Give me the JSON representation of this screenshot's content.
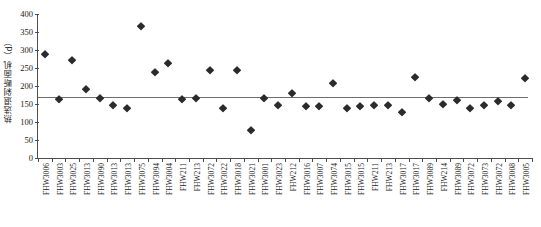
{
  "chart_data": {
    "type": "scatter",
    "title": "",
    "subtitle": "",
    "xlabel": "",
    "ylabel": "热选退剁断面机（d）",
    "ylim": [
      0,
      400
    ],
    "yticks": [
      0,
      50,
      100,
      150,
      200,
      250,
      300,
      350,
      400
    ],
    "grid": false,
    "legend": "none",
    "reference_line": {
      "label": "mean",
      "value": 170,
      "color": "#6e6e6e"
    },
    "marker": {
      "shape": "diamond",
      "color": "#2b2b2b",
      "size": 6
    },
    "categories": [
      "FHW3006",
      "FHW3003",
      "FHW3025",
      "FHW3013",
      "FHW3090",
      "FHW3013",
      "FHW3013",
      "FHW3075",
      "FHW3094",
      "FHW3004",
      "FHW211",
      "FHW213",
      "FHW3072",
      "FHW3022",
      "FHW3018",
      "FHW3021",
      "FHW3001",
      "FHW3023",
      "FHW212",
      "FHW3016",
      "FHW3007",
      "FHW3074",
      "FHW3015",
      "FHW3015",
      "FHW211",
      "FHW213",
      "FHW3017",
      "FHW3017",
      "FHW3089",
      "FHW214",
      "FHW3089",
      "FHW3072",
      "FHW3073",
      "FHW3072",
      "FHW3008",
      "FHW3005"
    ],
    "values": [
      288,
      165,
      272,
      192,
      167,
      146,
      140,
      368,
      238,
      265,
      163,
      166,
      245,
      138,
      245,
      78,
      166,
      147,
      180,
      145,
      144,
      208,
      138,
      144,
      146,
      146,
      128,
      225,
      168,
      150,
      160,
      140,
      146,
      158,
      148,
      222
    ]
  }
}
